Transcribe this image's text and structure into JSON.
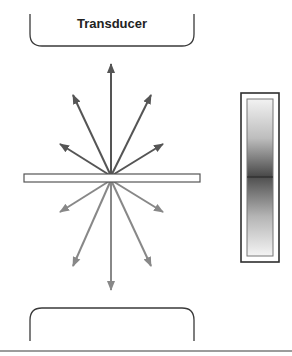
{
  "diagram": {
    "top_transducer": {
      "label": "Transducer"
    },
    "bottom_transducer": {
      "label": ""
    },
    "colors": {
      "outline": "#3a3a3a",
      "upper_arrows": "#555555",
      "lower_arrows": "#888888",
      "bar_fill": "#ffffff",
      "gauge_top": "#f2f2f2",
      "gauge_mid": "#4a4a4a",
      "gauge_bottom": "#f4f4f4"
    },
    "origin": {
      "x": 111,
      "y": 177
    },
    "upper_arrows": [
      {
        "name": "up",
        "x": 111,
        "y": 62
      },
      {
        "name": "up-left-steep",
        "x": 72,
        "y": 93
      },
      {
        "name": "up-right-steep",
        "x": 152,
        "y": 93
      },
      {
        "name": "up-left-shallow",
        "x": 58,
        "y": 143
      },
      {
        "name": "up-right-shallow",
        "x": 165,
        "y": 143
      }
    ],
    "lower_arrows": [
      {
        "name": "down",
        "x": 111,
        "y": 292
      },
      {
        "name": "down-left-steep",
        "x": 72,
        "y": 268
      },
      {
        "name": "down-right-steep",
        "x": 152,
        "y": 268
      },
      {
        "name": "down-left-shallow",
        "x": 58,
        "y": 213
      },
      {
        "name": "down-right-shallow",
        "x": 165,
        "y": 213
      }
    ]
  }
}
